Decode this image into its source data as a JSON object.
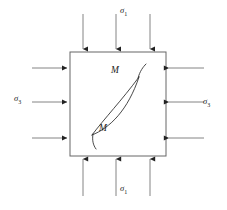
{
  "figure": {
    "type": "engineering-diagram",
    "background_color": "#ffffff",
    "line_color": "#333333",
    "arrow_color": "#555555",
    "text_color": "#222222"
  },
  "element": {
    "name": "stress-square",
    "x": 70,
    "y": 52,
    "width": 96,
    "height": 104,
    "stroke": "#555555",
    "fill": "none"
  },
  "labels": {
    "sigma_top": {
      "symbol": "σ",
      "subscript": "1",
      "x": 124,
      "y": 10
    },
    "sigma_bottom": {
      "symbol": "σ",
      "subscript": "1",
      "x": 124,
      "y": 186
    },
    "sigma_left": {
      "symbol": "σ",
      "subscript": "3",
      "x": 16,
      "y": 96
    },
    "sigma_right": {
      "symbol": "σ",
      "subscript": "3",
      "x": 203,
      "y": 99
    },
    "m_upper": {
      "text": "M",
      "x": 113,
      "y": 73
    },
    "m_lower": {
      "text": "M",
      "x": 95,
      "y": 128
    }
  },
  "arrows": {
    "top": {
      "direction": "down",
      "count": 3,
      "label": "σ₁",
      "positions_x": [
        83,
        116,
        150
      ],
      "start_y": 14,
      "end_y": 50
    },
    "bottom": {
      "direction": "up",
      "count": 3,
      "label": "σ₁",
      "positions_x": [
        83,
        116,
        150
      ],
      "start_y": 196,
      "end_y": 158
    },
    "left": {
      "direction": "right",
      "count": 3,
      "label": "σ₃",
      "positions_y": [
        68,
        102,
        138
      ],
      "start_x": 32,
      "end_x": 68
    },
    "right": {
      "direction": "left",
      "count": 3,
      "label": "σ₃",
      "positions_y": [
        68,
        102,
        138
      ],
      "start_x": 204,
      "end_x": 168
    }
  },
  "crack": {
    "name": "lens-shaped-crack",
    "stroke": "#333333",
    "upper_tip": {
      "x": 139,
      "y": 77
    },
    "lower_tip": {
      "x": 92,
      "y": 135
    },
    "upper_tail": {
      "from_x": 139,
      "from_y": 77,
      "to_x": 145,
      "to_y": 66
    },
    "lower_tail": {
      "from_x": 92,
      "from_y": 135,
      "to_x": 95,
      "to_y": 147
    }
  }
}
